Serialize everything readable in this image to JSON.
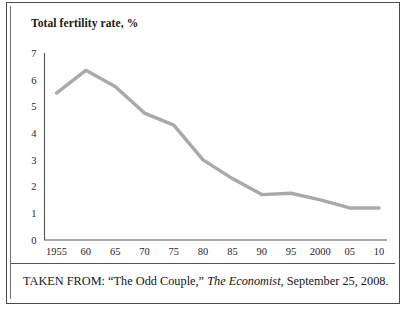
{
  "figure": {
    "caption_prefix": "TAKEN FROM: “The Odd Couple,” ",
    "caption_source": "The Economist",
    "caption_suffix": ", September 25, 2008."
  },
  "style": {
    "line_color": "#a9a9a9",
    "axis_color": "#555555",
    "border_color": "#4a4a4a",
    "text_color": "#1a1a1a",
    "background": "#ffffff"
  },
  "chart_data": {
    "type": "line",
    "title": "Total fertility rate, %",
    "xlabel": "",
    "ylabel": "",
    "grid": false,
    "legend": "none",
    "xlim": [
      1955,
      2010
    ],
    "ylim": [
      0,
      7
    ],
    "yticks": [
      0,
      1,
      2,
      3,
      4,
      5,
      6,
      7
    ],
    "ytick_labels": [
      "0",
      "1",
      "2",
      "3",
      "4",
      "5",
      "6",
      "7"
    ],
    "x": [
      1955,
      1960,
      1965,
      1970,
      1975,
      1980,
      1985,
      1990,
      1995,
      2000,
      2005,
      2010
    ],
    "xtick_labels": [
      "1955",
      "60",
      "65",
      "70",
      "75",
      "80",
      "85",
      "90",
      "95",
      "2000",
      "05",
      "10"
    ],
    "values": [
      5.5,
      6.35,
      5.75,
      4.75,
      4.3,
      3.0,
      2.3,
      1.7,
      1.75,
      1.5,
      1.2,
      1.2
    ],
    "series": [
      {
        "name": "Total fertility rate",
        "values": [
          5.5,
          6.35,
          5.75,
          4.75,
          4.3,
          3.0,
          2.3,
          1.7,
          1.75,
          1.5,
          1.2,
          1.2
        ]
      }
    ]
  }
}
